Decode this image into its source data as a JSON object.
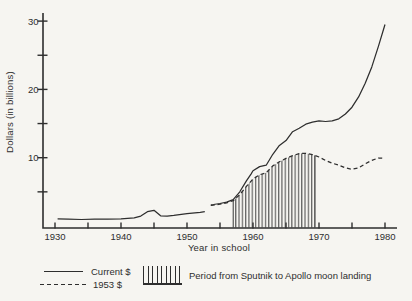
{
  "figure": {
    "background_color": "#f6f5f1",
    "ink_color": "#2e2e2e"
  },
  "chart_data": {
    "type": "line",
    "title": "",
    "xlabel": "Year in school",
    "ylabel": "Dollars (in billions)",
    "x_axis": {
      "min": 1930,
      "max": 1980,
      "tick_step": 5,
      "labeled_ticks": [
        1930,
        1940,
        1950,
        1960,
        1970,
        1980
      ]
    },
    "y_axis": {
      "min": 0,
      "max": 30,
      "tick_step": 5,
      "labeled_ticks": [
        10,
        20,
        30
      ]
    },
    "grid": false,
    "series": [
      {
        "name": "Current $",
        "style": "solid",
        "segments": [
          [
            [
              1930.4,
              1.05
            ],
            [
              1932,
              1.0
            ],
            [
              1934,
              0.95
            ],
            [
              1936,
              1.0
            ],
            [
              1938,
              1.0
            ],
            [
              1940,
              1.05
            ],
            [
              1942,
              1.2
            ],
            [
              1943,
              1.45
            ],
            [
              1944,
              2.1
            ],
            [
              1945,
              2.3
            ],
            [
              1946,
              1.5
            ],
            [
              1947,
              1.45
            ],
            [
              1948,
              1.55
            ],
            [
              1950,
              1.8
            ],
            [
              1952,
              2.0
            ],
            [
              1952.7,
              2.1
            ]
          ],
          [
            [
              1953.6,
              3.1
            ],
            [
              1954,
              3.15
            ],
            [
              1955,
              3.3
            ],
            [
              1956,
              3.5
            ],
            [
              1957,
              3.85
            ],
            [
              1958,
              5.0
            ],
            [
              1959,
              6.6
            ],
            [
              1959.7,
              7.6
            ],
            [
              1960,
              8.1
            ],
            [
              1961,
              8.7
            ],
            [
              1962,
              8.9
            ],
            [
              1963,
              10.5
            ],
            [
              1964,
              11.8
            ],
            [
              1965,
              12.5
            ],
            [
              1966,
              13.8
            ],
            [
              1967,
              14.3
            ],
            [
              1968,
              14.9
            ],
            [
              1969,
              15.2
            ],
            [
              1970,
              15.4
            ],
            [
              1971,
              15.3
            ],
            [
              1972,
              15.4
            ],
            [
              1973,
              15.7
            ],
            [
              1974,
              16.4
            ],
            [
              1975,
              17.4
            ],
            [
              1976,
              18.9
            ],
            [
              1977,
              20.9
            ],
            [
              1978,
              23.3
            ],
            [
              1979,
              26.3
            ],
            [
              1980,
              29.5
            ]
          ]
        ]
      },
      {
        "name": "1953 $",
        "style": "dashed",
        "segments": [
          [
            [
              1953.6,
              3.0
            ],
            [
              1954,
              3.05
            ],
            [
              1955,
              3.2
            ],
            [
              1956,
              3.4
            ],
            [
              1957,
              3.7
            ],
            [
              1958,
              4.6
            ],
            [
              1959,
              5.8
            ],
            [
              1960,
              6.9
            ],
            [
              1961,
              7.5
            ],
            [
              1962,
              7.8
            ],
            [
              1963,
              8.8
            ],
            [
              1964,
              9.4
            ],
            [
              1965,
              9.9
            ],
            [
              1966,
              10.3
            ],
            [
              1967,
              10.6
            ],
            [
              1968,
              10.65
            ],
            [
              1969,
              10.45
            ],
            [
              1970,
              10.1
            ],
            [
              1971,
              9.6
            ],
            [
              1972,
              9.2
            ],
            [
              1973,
              8.9
            ],
            [
              1974,
              8.5
            ],
            [
              1975,
              8.3
            ],
            [
              1976,
              8.5
            ],
            [
              1977,
              9.1
            ],
            [
              1978,
              9.6
            ],
            [
              1979,
              9.95
            ],
            [
              1980,
              9.9
            ]
          ]
        ]
      }
    ],
    "annotation_region": {
      "label": "Period from Sputnik to Apollo moon landing",
      "start_year": 1957,
      "end_year": 1969.4,
      "bounded_by_series": "1953 $",
      "fill": "vertical-hatch"
    },
    "legend": {
      "position": "below",
      "items": [
        {
          "label": "Current $",
          "swatch": "solid-line"
        },
        {
          "label": "1953 $",
          "swatch": "dashed-line"
        },
        {
          "label": "Period from Sputnik to Apollo moon landing",
          "swatch": "vertical-hatch"
        }
      ]
    }
  }
}
